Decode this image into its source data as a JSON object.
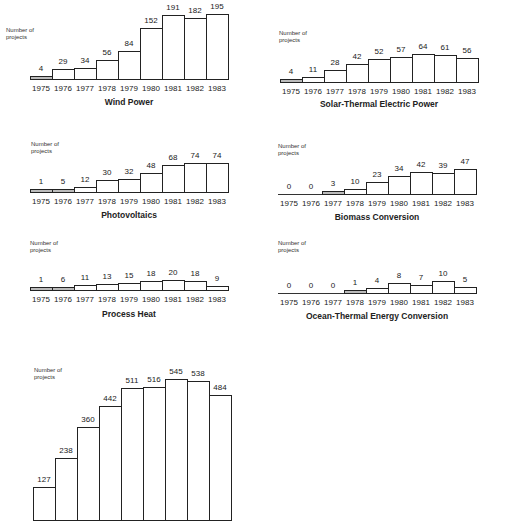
{
  "chart_data": [
    {
      "type": "bar",
      "title": "Wind Power",
      "ylabel": "Number of projects",
      "categories": [
        "1975",
        "1976",
        "1977",
        "1978",
        "1979",
        "1980",
        "1981",
        "1982",
        "1983"
      ],
      "values": [
        4,
        29,
        34,
        56,
        84,
        152,
        191,
        182,
        195
      ],
      "grid": false
    },
    {
      "type": "bar",
      "title": "Solar-Thermal Electric Power",
      "ylabel": "Number of projects",
      "categories": [
        "1975",
        "1976",
        "1977",
        "1978",
        "1979",
        "1980",
        "1981",
        "1982",
        "1983"
      ],
      "values": [
        4,
        11,
        28,
        42,
        52,
        57,
        64,
        61,
        56
      ],
      "grid": false
    },
    {
      "type": "bar",
      "title": "Photovoltaics",
      "ylabel": "Number of projects",
      "categories": [
        "1975",
        "1976",
        "1977",
        "1978",
        "1979",
        "1980",
        "1981",
        "1982",
        "1983"
      ],
      "values": [
        1,
        5,
        12,
        30,
        32,
        48,
        68,
        74,
        74
      ],
      "grid": false
    },
    {
      "type": "bar",
      "title": "Biomass Conversion",
      "ylabel": "Number of projects",
      "categories": [
        "1975",
        "1976",
        "1977",
        "1978",
        "1979",
        "1980",
        "1981",
        "1982",
        "1983"
      ],
      "values": [
        0,
        0,
        3,
        10,
        23,
        34,
        42,
        39,
        47
      ],
      "grid": false
    },
    {
      "type": "bar",
      "title": "Process Heat",
      "ylabel": "Number of projects",
      "categories": [
        "1975",
        "1976",
        "1977",
        "1978",
        "1979",
        "1980",
        "1981",
        "1982",
        "1983"
      ],
      "values": [
        1,
        6,
        11,
        13,
        15,
        18,
        20,
        18,
        9
      ],
      "grid": false
    },
    {
      "type": "bar",
      "title": "Ocean-Thermal Energy Conversion",
      "ylabel": "Number of projects",
      "categories": [
        "1975",
        "1976",
        "1977",
        "1978",
        "1979",
        "1980",
        "1981",
        "1982",
        "1983"
      ],
      "values": [
        0,
        0,
        0,
        1,
        4,
        8,
        7,
        10,
        5
      ],
      "grid": false
    },
    {
      "type": "bar",
      "title": "",
      "ylabel": "Number of projects",
      "categories": [
        "1975",
        "1976",
        "1977",
        "1978",
        "1979",
        "1980",
        "1981",
        "1982",
        "1983"
      ],
      "values": [
        127,
        238,
        360,
        442,
        511,
        516,
        545,
        538,
        484
      ],
      "grid": false,
      "note": "chart cropped at bottom; x-axis labels and title not visible"
    }
  ],
  "labels": {
    "number_of": "Number of",
    "projects": "projects"
  }
}
